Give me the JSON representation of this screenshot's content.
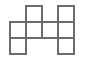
{
  "figure": {
    "name": "polyomino-figure",
    "kind": "grid-polyomino",
    "cell_count": 6,
    "grid_columns": 4,
    "grid_rows": 3,
    "cell_size_px": 16,
    "origin_x_px": 10,
    "origin_y_px": 6,
    "line_color": "#6b6b6b",
    "fill_color": "#ffffff",
    "background_color": "#ffffff",
    "line_width_px": 1.4,
    "cells": [
      {
        "row": 0,
        "col": 1,
        "label": "top-row-second-column"
      },
      {
        "row": 0,
        "col": 3,
        "label": "top-row-fourth-column"
      },
      {
        "row": 1,
        "col": 0,
        "label": "middle-row-first-column"
      },
      {
        "row": 1,
        "col": 1,
        "label": "middle-row-second-column"
      },
      {
        "row": 1,
        "col": 2,
        "label": "middle-row-third-column"
      },
      {
        "row": 1,
        "col": 3,
        "label": "middle-row-fourth-column"
      },
      {
        "row": 2,
        "col": 0,
        "label": "bottom-row-first-column"
      },
      {
        "row": 2,
        "col": 3,
        "label": "bottom-row-fourth-column"
      }
    ],
    "rows": [
      {
        "index": 0,
        "occupied_columns": [
          1,
          3
        ],
        "count": 2
      },
      {
        "index": 1,
        "occupied_columns": [
          0,
          1,
          2,
          3
        ],
        "count": 4
      },
      {
        "index": 2,
        "occupied_columns": [
          0,
          3
        ],
        "count": 2
      }
    ]
  }
}
